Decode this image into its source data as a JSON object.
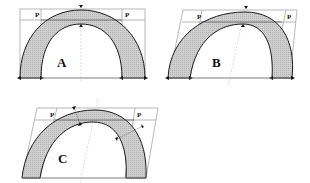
{
  "figure": {
    "type": "diagram",
    "colors": {
      "background": "#ffffff",
      "arch_fill": "#c8c8c8",
      "arch_stroke": "#1a1a1a",
      "frame_stroke": "#9a9a9a",
      "axis_stroke": "#b0b0b0"
    },
    "panels": [
      {
        "id": "A",
        "label": "A",
        "point_labels": [
          "P",
          "P"
        ],
        "shear": "none"
      },
      {
        "id": "B",
        "label": "B",
        "point_labels": [
          "P",
          "P"
        ],
        "shear": "sheared frame"
      },
      {
        "id": "C",
        "label": "C",
        "point_labels": [
          "P",
          "P"
        ],
        "shear": "sheared frame, oblique thickness markers"
      }
    ]
  }
}
